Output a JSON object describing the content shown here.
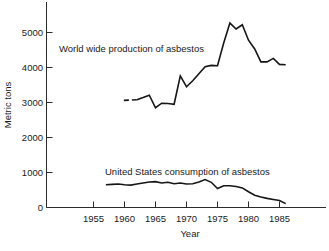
{
  "figure": {
    "caption": "FIGURE 1-17  World wide ...",
    "caption_visible": false
  },
  "chart_data": {
    "type": "line",
    "title": "",
    "xlabel": "Year",
    "ylabel": "Metric tons",
    "grid": false,
    "legend": "inline-annotations",
    "xlim": [
      1952,
      1988
    ],
    "ylim": [
      0,
      5500
    ],
    "xticks": [
      1955,
      1960,
      1965,
      1970,
      1975,
      1980,
      1985
    ],
    "yticks": [
      0,
      1000,
      2000,
      3000,
      4000,
      5000
    ],
    "xtick_labels": [
      "1955",
      "1960",
      "1965",
      "1970",
      "1975",
      "1980",
      "1985"
    ],
    "ytick_labels": [
      "0",
      "1000",
      "2000",
      "3000",
      "4000",
      "5000"
    ],
    "series": [
      {
        "name": "World wide production of asbestos",
        "label": "World wide production of asbestos",
        "style": "solid",
        "dashed_lead_in": true,
        "x": [
          1962,
          1963,
          1964,
          1965,
          1966,
          1967,
          1968,
          1969,
          1970,
          1971,
          1972,
          1973,
          1974,
          1975,
          1976,
          1977,
          1978,
          1979,
          1980,
          1981,
          1982,
          1983,
          1984,
          1985,
          1986
        ],
        "values": [
          3080,
          3140,
          3210,
          2850,
          2980,
          2970,
          2950,
          3760,
          3450,
          3620,
          3820,
          4020,
          4060,
          4050,
          4700,
          5270,
          5100,
          5220,
          4780,
          4530,
          4160,
          4160,
          4260,
          4090,
          4080
        ]
      },
      {
        "name": "United States consumption of asbestos",
        "label": "United States consumption of asbestos",
        "style": "solid",
        "x": [
          1957,
          1958,
          1959,
          1960,
          1961,
          1962,
          1963,
          1964,
          1965,
          1966,
          1967,
          1968,
          1969,
          1970,
          1971,
          1972,
          1973,
          1974,
          1975,
          1976,
          1977,
          1978,
          1979,
          1980,
          1981,
          1982,
          1983,
          1984,
          1985,
          1986
        ],
        "values": [
          650,
          660,
          670,
          650,
          640,
          670,
          700,
          730,
          740,
          700,
          720,
          680,
          700,
          670,
          680,
          730,
          800,
          720,
          540,
          620,
          620,
          600,
          560,
          450,
          350,
          300,
          260,
          230,
          200,
          110
        ]
      }
    ],
    "annotations": [
      {
        "text": "World wide production of asbestos",
        "x": 1963,
        "y": 4480
      },
      {
        "text": "United States consumption of asbestos",
        "x": 1968,
        "y": 1080
      }
    ]
  }
}
